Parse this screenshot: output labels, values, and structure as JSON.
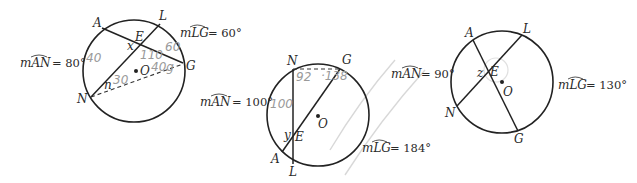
{
  "figures": [
    {
      "id": "figure-1",
      "points": {
        "A": "A",
        "L": "L",
        "E": "E",
        "G": "G",
        "N": "N",
        "O": "O"
      },
      "unknowns": {
        "x": "x",
        "n": "n"
      },
      "measures": {
        "arc_AN": {
          "name": "mAN",
          "value": "= 80°"
        },
        "arc_LG": {
          "name": "mLG",
          "value": "= 60°"
        }
      },
      "handwritten": [
        "40",
        "110",
        "60",
        "40g",
        "30"
      ]
    },
    {
      "id": "figure-2",
      "points": {
        "N": "N",
        "G": "G",
        "E": "E",
        "A": "A",
        "L": "L",
        "O": "O"
      },
      "unknowns": {
        "y": "y"
      },
      "measures": {
        "arc_AN": {
          "name": "mAN",
          "value": "= 100°"
        },
        "arc_LG": {
          "name": "mLG",
          "value": "= 184°"
        }
      },
      "handwritten": [
        "92",
        "·138",
        "100"
      ]
    },
    {
      "id": "figure-3",
      "points": {
        "A": "A",
        "L": "L",
        "E": "E",
        "N": "N",
        "G": "G",
        "O": "O"
      },
      "unknowns": {
        "z": "z"
      },
      "measures": {
        "arc_AN": {
          "name": "mAN",
          "value": "= 90°"
        },
        "arc_LG": {
          "name": "mLG",
          "value": "= 130°"
        }
      },
      "handwritten": []
    }
  ]
}
